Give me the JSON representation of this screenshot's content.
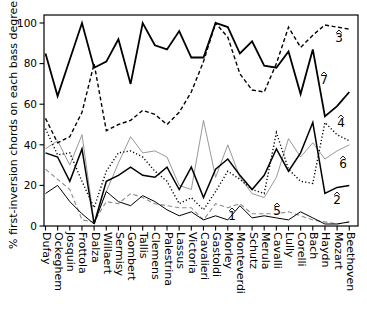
{
  "figure": {
    "title": "",
    "background": "#ffffff",
    "axis_color": "#000000"
  },
  "chart_data": {
    "type": "line",
    "title": "",
    "xlabel": "",
    "ylabel": "% first-inversion chords on each bass degree",
    "ylim": [
      0,
      100
    ],
    "yticks": [
      0,
      20,
      40,
      60,
      80,
      100
    ],
    "grid": "off",
    "legend_position": "inline-labels",
    "categories": [
      "Dufay",
      "Ockeghem",
      "Josquin",
      "Frottola",
      "Dalza",
      "Willaert",
      "Sermisy",
      "Gombert",
      "Tallis",
      "Clemens",
      "Palestrina",
      "Lassus",
      "Victoria",
      "Cavalieri",
      "Gastoldi",
      "Morley",
      "Monteverdi",
      "Schutz",
      "Merula",
      "Cavalli",
      "Lully",
      "Corelli",
      "Bach",
      "Haydn",
      "Mozart",
      "Beethoven"
    ],
    "series": [
      {
        "name": "scale-degree-6",
        "label": "6",
        "style": "solid-thin",
        "color": "#8c8c8c",
        "values": [
          38,
          42,
          30,
          45,
          2,
          17,
          31,
          44,
          36,
          37,
          34,
          20,
          18,
          52,
          24,
          40,
          24,
          16,
          14,
          24,
          43,
          34,
          41,
          33,
          37,
          40
        ]
      },
      {
        "name": "scale-degree-5",
        "label": "5",
        "style": "dashed-thin",
        "color": "#8c8c8c",
        "values": [
          28,
          23,
          18,
          3,
          2,
          12,
          11,
          16,
          14,
          11,
          10,
          9,
          9,
          3,
          11,
          9,
          11,
          6,
          6,
          6,
          7,
          5,
          3,
          2,
          1,
          2
        ]
      },
      {
        "name": "scale-degree-4",
        "label": "4",
        "style": "dotted",
        "color": "#000000",
        "values": [
          48,
          35,
          36,
          22,
          9,
          27,
          36,
          37,
          34,
          27,
          22,
          11,
          14,
          8,
          17,
          27,
          23,
          18,
          16,
          46,
          28,
          22,
          21,
          51,
          45,
          42
        ]
      },
      {
        "name": "scale-degree-3",
        "label": "3",
        "style": "dashed",
        "color": "#000000",
        "values": [
          53,
          41,
          44,
          56,
          80,
          47,
          50,
          52,
          57,
          55,
          50,
          56,
          66,
          81,
          100,
          93,
          75,
          67,
          66,
          80,
          98,
          88,
          94,
          99,
          98,
          97
        ]
      },
      {
        "name": "scale-degree-1",
        "label": "1",
        "style": "solid-fine",
        "color": "#000000",
        "values": [
          16,
          20,
          12,
          6,
          1,
          17,
          12,
          10,
          15,
          12,
          8,
          5,
          7,
          3,
          5,
          3,
          10,
          4,
          5,
          4,
          3,
          7,
          4,
          1,
          1,
          2
        ]
      },
      {
        "name": "scale-degree-2",
        "label": "2",
        "style": "solid-medium",
        "color": "#000000",
        "values": [
          36,
          34,
          22,
          38,
          1,
          22,
          25,
          29,
          25,
          24,
          29,
          18,
          29,
          14,
          28,
          33,
          25,
          18,
          25,
          38,
          27,
          36,
          51,
          16,
          19,
          20
        ]
      },
      {
        "name": "scale-degree-7",
        "label": "7",
        "style": "solid-thick",
        "color": "#000000",
        "values": [
          85,
          64,
          82,
          100,
          78,
          81,
          92,
          70,
          100,
          89,
          87,
          96,
          83,
          83,
          100,
          98,
          85,
          91,
          79,
          78,
          86,
          65,
          87,
          54,
          59,
          66
        ]
      }
    ],
    "annotations": [
      {
        "text": "3",
        "x": 339,
        "y": 42
      },
      {
        "text": "7",
        "x": 324,
        "y": 84
      },
      {
        "text": "4",
        "x": 341,
        "y": 127
      },
      {
        "text": "6",
        "x": 343,
        "y": 168
      },
      {
        "text": "2",
        "x": 337,
        "y": 204
      },
      {
        "text": "5",
        "x": 277,
        "y": 215
      },
      {
        "text": "1",
        "x": 232,
        "y": 220
      }
    ]
  }
}
